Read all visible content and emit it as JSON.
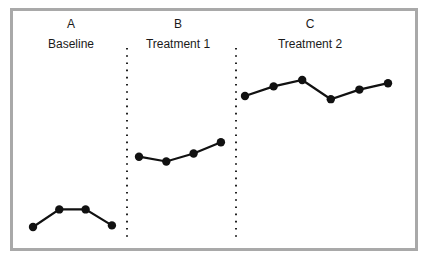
{
  "chart_data": {
    "type": "line",
    "title": "",
    "xlabel": "",
    "ylabel": "",
    "grid": false,
    "legend": null,
    "phases": [
      {
        "letter": "A",
        "name": "Baseline",
        "values": [
          1.0,
          2.1,
          2.1,
          1.1
        ]
      },
      {
        "letter": "B",
        "name": "Treatment 1",
        "values": [
          5.4,
          5.1,
          5.6,
          6.3
        ]
      },
      {
        "letter": "C",
        "name": "Treatment 2",
        "values": [
          9.2,
          9.8,
          10.2,
          9.0,
          9.6,
          10.0
        ]
      }
    ],
    "phase_change_lines": [
      "A|B",
      "B|C"
    ],
    "phase_line_style": "dotted",
    "marker": "filled-circle",
    "line_color": "#111111",
    "frame_color": "#a9a9a9"
  },
  "labels": {
    "a": "A",
    "b": "B",
    "c": "C",
    "baseline": "Baseline",
    "t1": "Treatment 1",
    "t2": "Treatment 2"
  }
}
